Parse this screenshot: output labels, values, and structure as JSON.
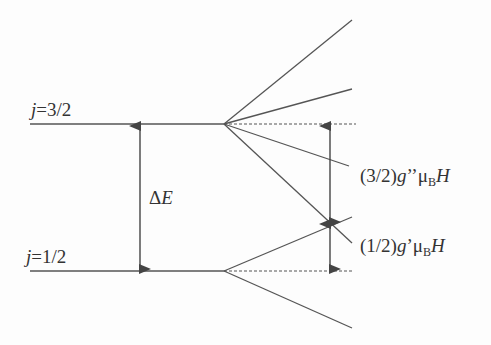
{
  "diagram": {
    "levels": [
      {
        "id": "upper",
        "label_var": "j",
        "label_eq": "=3/2",
        "y": 124
      },
      {
        "id": "lower",
        "label_var": "j",
        "label_eq": "=1/2",
        "y": 271
      }
    ],
    "gap_label": {
      "delta": "Δ",
      "var": "E"
    },
    "splitting_labels": [
      {
        "prefix": "(3/2)",
        "g": "g",
        "prime": "’’",
        "mu": "μ",
        "sub": "B",
        "field": "H"
      },
      {
        "prefix": "(1/2)",
        "g": "g",
        "prime": "’",
        "mu": "μ",
        "sub": "B",
        "field": "H"
      }
    ],
    "upper_sublevels_end_y": [
      20,
      89,
      166,
      243
    ],
    "lower_sublevels_end_y": [
      217,
      328
    ],
    "colors": {
      "line": "#555555",
      "text": "#333333",
      "background": "#fdfdfd"
    }
  }
}
